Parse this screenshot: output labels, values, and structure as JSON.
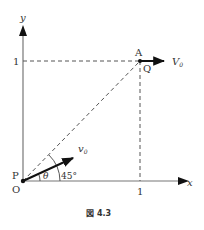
{
  "figure": {
    "caption_symbol": "図",
    "caption_number": "4.3",
    "axes": {
      "x_label": "x",
      "y_label": "y",
      "x_tick": "1",
      "y_tick": "1",
      "origin_label": "O"
    },
    "points": {
      "P": "P",
      "A": "A",
      "Q": "Q"
    },
    "vectors": {
      "launch_velocity": "v",
      "launch_velocity_sub": "0",
      "horizontal_velocity": "V",
      "horizontal_velocity_sub": "0"
    },
    "angles": {
      "theta": "θ",
      "diagonal": "45°"
    },
    "colors": {
      "axis": "#777777",
      "dashed": "#555555",
      "arrow": "#111111",
      "text": "#333333"
    }
  }
}
